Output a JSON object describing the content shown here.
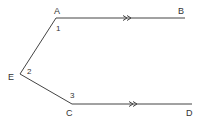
{
  "diagram": {
    "points": {
      "A": {
        "label": "A"
      },
      "B": {
        "label": "B"
      },
      "C": {
        "label": "C"
      },
      "D": {
        "label": "D"
      },
      "E": {
        "label": "E"
      }
    },
    "angles": [
      "1",
      "2",
      "3"
    ],
    "segments": [
      "AB",
      "AE",
      "EC",
      "CD"
    ],
    "parallel_marks": ">>",
    "colors": {
      "line": "#444444",
      "text": "#333333",
      "background": "#ffffff"
    }
  }
}
